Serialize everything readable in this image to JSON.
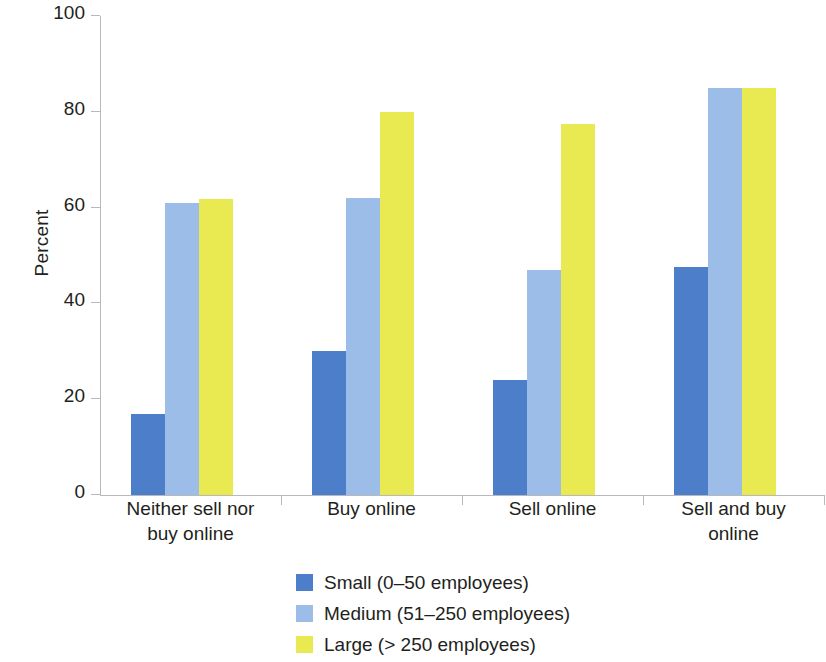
{
  "chart_data": {
    "type": "bar",
    "title": "",
    "xlabel": "",
    "ylabel": "Percent",
    "ylim": [
      0,
      100
    ],
    "yticks": [
      0,
      20,
      40,
      60,
      80,
      100
    ],
    "ytick_labels": [
      "0",
      "20",
      "40",
      "60",
      "80",
      "100"
    ],
    "grid": false,
    "legend_position": "bottom-center",
    "categories": [
      "Neither sell nor buy online",
      "Buy online",
      "Sell online",
      "Sell and buy online"
    ],
    "category_lines": [
      [
        "Neither sell nor",
        "buy online"
      ],
      [
        "Buy online"
      ],
      [
        "Sell online"
      ],
      [
        "Sell and buy",
        "online"
      ]
    ],
    "series": [
      {
        "name": "Small (0–50 employees)",
        "color": "#4c7ec9",
        "values": [
          17,
          30,
          24,
          47.5
        ]
      },
      {
        "name": "Medium (51–250 employees)",
        "color": "#9dbde9",
        "values": [
          61,
          62,
          47,
          85
        ]
      },
      {
        "name": "Large (> 250 employees)",
        "color": "#e9ea52",
        "values": [
          61.8,
          80,
          77.5,
          85
        ]
      }
    ]
  },
  "colors": {
    "small": "#4c7ec9",
    "medium": "#9dbde9",
    "large": "#e9ea52",
    "axis": "#b9b9bb",
    "text": "#231f20",
    "background": "#ffffff"
  }
}
